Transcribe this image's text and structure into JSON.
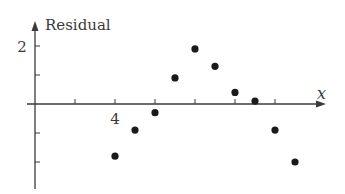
{
  "chart_data": {
    "type": "scatter",
    "title": "",
    "xlabel": "x",
    "ylabel": "Residual",
    "x_tick_labels": [
      {
        "value": 4,
        "label": "4"
      }
    ],
    "y_tick_labels": [
      {
        "value": 2,
        "label": "2"
      }
    ],
    "x_ticks": [
      2,
      4,
      6,
      8,
      10,
      12
    ],
    "y_ticks": [
      -2,
      -1,
      1,
      2
    ],
    "xlim": [
      0,
      14.5
    ],
    "ylim": [
      -2.9,
      2.8
    ],
    "grid": false,
    "legend": null,
    "series": [
      {
        "name": "Residuals",
        "color": "#1a1a1a",
        "points": [
          {
            "x": 4,
            "y": -1.8
          },
          {
            "x": 5,
            "y": -0.9
          },
          {
            "x": 6,
            "y": -0.3
          },
          {
            "x": 7,
            "y": 0.9
          },
          {
            "x": 8,
            "y": 1.9
          },
          {
            "x": 9,
            "y": 1.3
          },
          {
            "x": 10,
            "y": 0.4
          },
          {
            "x": 11,
            "y": 0.1
          },
          {
            "x": 12,
            "y": -0.9
          },
          {
            "x": 13,
            "y": -2.0
          }
        ]
      }
    ]
  },
  "labels": {
    "y_axis": "Residual",
    "x_axis": "x",
    "y_tick_2": "2",
    "x_tick_4": "4"
  },
  "colors": {
    "axis": "#3a3a3a",
    "point": "#1a1a1a"
  }
}
